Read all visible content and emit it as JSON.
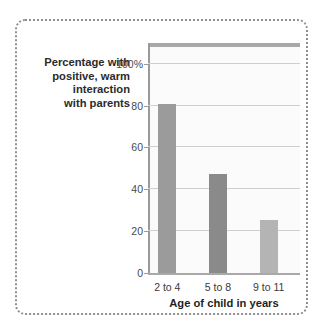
{
  "chart_data": {
    "type": "bar",
    "title": "",
    "categories": [
      "2 to 4",
      "5 to 8",
      "9 to 11"
    ],
    "values": [
      81,
      47,
      25
    ],
    "series": [
      {
        "name": "Percentage with positive, warm interaction with parents",
        "values": [
          81,
          47,
          25
        ]
      }
    ],
    "xlabel": "Age of child in years",
    "ylabel": "Percentage with positive, warm interaction with parents",
    "ylabel_lines": [
      "Percentage with",
      "positive, warm",
      "interaction",
      "with parents"
    ],
    "ylim": [
      0,
      110
    ],
    "ytick_values": [
      0,
      20,
      40,
      60,
      80,
      100
    ],
    "ytick_labels": [
      "0",
      "20",
      "40",
      "60",
      "80",
      "100%"
    ],
    "grid": true,
    "gridlines_at": [
      20,
      40,
      60,
      80,
      100
    ],
    "legend": "none",
    "bar_colors": [
      "#9b9b9b",
      "#8a8a8a",
      "#b4b4b4"
    ],
    "colors": {
      "plot_background": "#fbfbfb",
      "gridline": "#cfcfcf",
      "axis": "#a9a9a9",
      "frame_border": "#8e8e8e",
      "text": "#2b2b2b"
    }
  }
}
